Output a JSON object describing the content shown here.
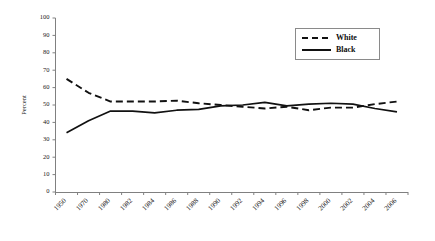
{
  "chart_data": {
    "type": "line",
    "title": "",
    "xlabel": "",
    "ylabel": "Percent",
    "ylim": [
      0,
      100
    ],
    "ytick_step": 10,
    "grid": false,
    "legend_position": "top-right",
    "categories": [
      "1950",
      "1970",
      "1980",
      "1982",
      "1984",
      "1986",
      "1988",
      "1990",
      "1992",
      "1994",
      "1996",
      "1998",
      "2000",
      "2002",
      "2004",
      "2006"
    ],
    "yticks": [
      "0",
      "10",
      "20",
      "30",
      "40",
      "50",
      "60",
      "70",
      "80",
      "90",
      "100"
    ],
    "series": [
      {
        "name": "White",
        "style": "dashed",
        "color": "#111111",
        "values": [
          65,
          57,
          52,
          52,
          52,
          52.5,
          51,
          50,
          49,
          48,
          49,
          47,
          48.5,
          48.5,
          50.5,
          52
        ]
      },
      {
        "name": "Black",
        "style": "solid",
        "color": "#111111",
        "values": [
          34,
          41,
          46.5,
          46.5,
          45.5,
          47,
          47.5,
          49.5,
          50,
          51.5,
          49.5,
          50.5,
          51,
          50.5,
          48,
          46
        ]
      }
    ]
  },
  "legend": {
    "entries": [
      {
        "label": "White"
      },
      {
        "label": "Black"
      }
    ]
  }
}
